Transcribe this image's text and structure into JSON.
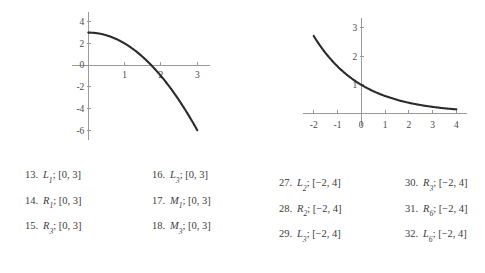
{
  "chart_data": [
    {
      "id": "left",
      "type": "line",
      "title": "",
      "xlabel": "",
      "ylabel": "",
      "xlim": [
        -0.45,
        3.35
      ],
      "ylim": [
        -6.9,
        4.9
      ],
      "xticks": [
        1,
        2,
        3
      ],
      "xtick_labels": [
        "1",
        "2",
        "3"
      ],
      "yticks": [
        4,
        2,
        0,
        -2,
        -4,
        -6
      ],
      "ytick_labels": [
        "4",
        "2",
        "0",
        "-2",
        "-4",
        "-6"
      ],
      "grid": false,
      "legend": "none",
      "description": "downward-opening parabola y = 3 - x^2 on [0,3]",
      "series": [
        {
          "name": "y = 3 - x^2",
          "x": [
            0,
            0.25,
            0.5,
            0.75,
            1.0,
            1.25,
            1.5,
            1.75,
            2.0,
            2.25,
            2.5,
            2.75,
            3.0
          ],
          "y": [
            3.0,
            2.94,
            2.75,
            2.44,
            2.0,
            1.44,
            0.75,
            -0.06,
            -1.0,
            -2.06,
            -3.25,
            -4.56,
            -6.0
          ]
        }
      ]
    },
    {
      "id": "right",
      "type": "line",
      "title": "",
      "xlabel": "",
      "ylabel": "",
      "xlim": [
        -2.45,
        4.45
      ],
      "ylim": [
        -0.45,
        3.35
      ],
      "xticks": [
        -2,
        -1,
        0,
        1,
        2,
        3,
        4
      ],
      "xtick_labels": [
        "-2",
        "-1",
        "0",
        "1",
        "2",
        "3",
        "4"
      ],
      "yticks": [
        1,
        2,
        3
      ],
      "ytick_labels": [
        "1",
        "2",
        "3"
      ],
      "grid": false,
      "legend": "none",
      "description": "decreasing exponential decay curve through (0,1) on [-2,4]",
      "series": [
        {
          "name": "y = e^(-0.5x)",
          "x": [
            -2,
            -1.5,
            -1,
            -0.5,
            0,
            0.5,
            1,
            1.5,
            2,
            2.5,
            3,
            3.5,
            4
          ],
          "y": [
            2.72,
            2.12,
            1.65,
            1.28,
            1.0,
            0.78,
            0.61,
            0.47,
            0.37,
            0.29,
            0.22,
            0.17,
            0.14
          ]
        }
      ]
    }
  ],
  "exercise_columns": [
    {
      "id": "col-1",
      "items": [
        {
          "number": "13.",
          "symbol": "L",
          "subscript": "1",
          "separator": ";",
          "interval": "[0, 3]"
        },
        {
          "number": "14.",
          "symbol": "R",
          "subscript": "1",
          "separator": ";",
          "interval": "[0, 3]"
        },
        {
          "number": "15.",
          "symbol": "R",
          "subscript": "3",
          "separator": ";",
          "interval": "[0, 3]"
        }
      ]
    },
    {
      "id": "col-2",
      "items": [
        {
          "number": "16.",
          "symbol": "L",
          "subscript": "3",
          "separator": ";",
          "interval": "[0, 3]"
        },
        {
          "number": "17.",
          "symbol": "M",
          "subscript": "1",
          "separator": ";",
          "interval": "[0, 3]"
        },
        {
          "number": "18.",
          "symbol": "M",
          "subscript": "3",
          "separator": ";",
          "interval": "[0, 3]"
        }
      ]
    },
    {
      "id": "col-3",
      "items": [
        {
          "number": "27.",
          "symbol": "L",
          "subscript": "2",
          "separator": ";",
          "interval": "[−2, 4]"
        },
        {
          "number": "28.",
          "symbol": "R",
          "subscript": "2",
          "separator": ";",
          "interval": "[−2, 4]"
        },
        {
          "number": "29.",
          "symbol": "L",
          "subscript": "3",
          "separator": ";",
          "interval": "[−2, 4]"
        }
      ]
    },
    {
      "id": "col-4",
      "items": [
        {
          "number": "30.",
          "symbol": "R",
          "subscript": "3",
          "separator": ";",
          "interval": "[−2, 4]"
        },
        {
          "number": "31.",
          "symbol": "R",
          "subscript": "6",
          "separator": ";",
          "interval": "[−2, 4]"
        },
        {
          "number": "32.",
          "symbol": "L",
          "subscript": "6",
          "separator": ";",
          "interval": "[−2, 4]"
        }
      ]
    }
  ],
  "colors": {
    "curve": "#2b2b2b",
    "axis": "#9a9a9a",
    "text": "#3c3c3c",
    "background": "#ffffff"
  }
}
